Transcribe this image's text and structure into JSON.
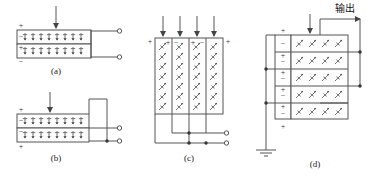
{
  "figure": {
    "title_text": "",
    "background": "#ffffff",
    "stroke_color": "#555555",
    "text_color": "#1a1a1a"
  },
  "panels": [
    {
      "id": "a",
      "label": "(a)",
      "type": "two-layer-horizontal-stack",
      "force_arrows": 1,
      "layers": 2,
      "dipole_direction": "vertical",
      "dipoles_per_layer": 8,
      "signs": [
        {
          "text": "+",
          "position": "above-top-left"
        },
        {
          "text": "−",
          "position": "inside-top-left"
        },
        {
          "text": "+",
          "position": "inside-bottom-left"
        },
        {
          "text": "−",
          "position": "below-bottom-left"
        }
      ],
      "terminals": 2,
      "junction_dots": 0
    },
    {
      "id": "b",
      "label": "(b)",
      "type": "two-layer-horizontal-series",
      "force_arrows": 1,
      "layers": 2,
      "dipole_direction": "vertical",
      "dipoles_per_layer": 8,
      "signs": [
        {
          "text": "+",
          "position": "above-top-left"
        },
        {
          "text": "−",
          "position": "inside-top-left"
        },
        {
          "text": "−",
          "position": "inside-bottom-left"
        },
        {
          "text": "+",
          "position": "below-bottom-left"
        }
      ],
      "terminals": 2,
      "junction_dots": 1
    },
    {
      "id": "c",
      "label": "(c)",
      "type": "four-column-vertical-parallel",
      "force_arrows": 4,
      "columns": 4,
      "dipole_direction": "diagonal",
      "dipole_rows": 7,
      "signs": [
        {
          "text": "+",
          "position": "left-outside"
        },
        {
          "text": "+",
          "position": "col1-top"
        },
        {
          "text": "−",
          "position": "col2-top"
        },
        {
          "text": "+",
          "position": "col3-top"
        },
        {
          "text": "−",
          "position": "col4-top"
        },
        {
          "text": "+",
          "position": "right-outside"
        }
      ],
      "terminals": 2,
      "junction_dots": 3
    },
    {
      "id": "d",
      "label": "(d)",
      "type": "stacked-layers-grounded",
      "force_arrows": 1,
      "rows": 5,
      "dipole_direction": "diagonal",
      "dipoles_per_row": 4,
      "signs": [
        {
          "text": "+",
          "position": "stack-top"
        },
        {
          "text": "−",
          "position": "cell-1"
        },
        {
          "text": "+",
          "position": "cell-2-top"
        },
        {
          "text": "−",
          "position": "cell-2"
        },
        {
          "text": "+",
          "position": "cell-3-top"
        },
        {
          "text": "−",
          "position": "cell-3"
        },
        {
          "text": "+",
          "position": "cell-4-top"
        },
        {
          "text": "−",
          "position": "cell-4"
        },
        {
          "text": "+",
          "position": "cell-5-top"
        },
        {
          "text": "−",
          "position": "cell-5"
        },
        {
          "text": "+",
          "position": "stack-bottom"
        }
      ],
      "output_label": "输出",
      "ground_symbol": true,
      "junction_dots": 5
    }
  ],
  "labels": {
    "panel_a": "(a)",
    "panel_b": "(b)",
    "panel_c": "(c)",
    "panel_d": "(d)",
    "output": "输出"
  }
}
